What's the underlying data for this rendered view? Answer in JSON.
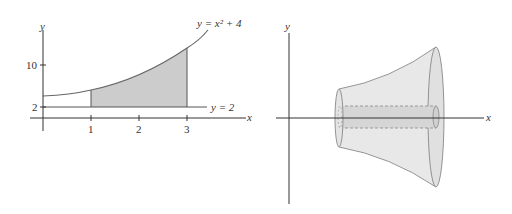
{
  "left_plot": {
    "y_axis_label": "y",
    "x_axis_label": "x",
    "y_ticks": [
      {
        "label": "10",
        "value": 10
      },
      {
        "label": "2",
        "value": 2
      }
    ],
    "x_ticks": [
      {
        "label": "1",
        "value": 1
      },
      {
        "label": "2",
        "value": 2
      },
      {
        "label": "3",
        "value": 3
      }
    ],
    "curve_label": "y = x² + 4",
    "line_label": "y = 2",
    "shaded_region": {
      "x_from": 1,
      "x_to": 3,
      "between": [
        "y = x^2 + 4",
        "y = 2"
      ]
    },
    "colors": {
      "shade": "#cccccc",
      "axis": "#333333",
      "curve": "#555555"
    }
  },
  "right_plot": {
    "y_axis_label": "y",
    "x_axis_label": "x",
    "description": "Solid of revolution (washer) formed by rotating shaded region about the x-axis",
    "colors": {
      "solid_fill": "#e6e6e6",
      "solid_edge": "#777777",
      "inner_cylinder": "#d4d4d4"
    }
  }
}
